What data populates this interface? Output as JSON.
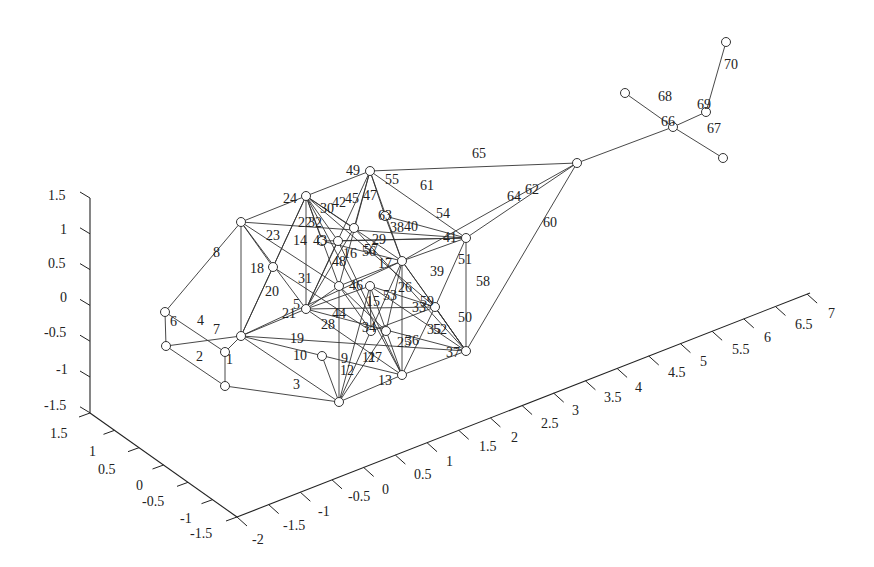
{
  "chart_data": {
    "type": "scatter",
    "subtype": "3d-network-graph",
    "title": "",
    "axes": {
      "z": {
        "ticks": [
          "1.5",
          "1",
          "0.5",
          "0",
          "-0.5",
          "-1",
          "-1.5"
        ],
        "range": [
          -1.5,
          1.5
        ]
      },
      "y": {
        "ticks": [
          "1.5",
          "1",
          "0.5",
          "0",
          "-0.5",
          "-1",
          "-1.5"
        ],
        "range": [
          -1.5,
          1.5
        ]
      },
      "x": {
        "ticks": [
          "-2",
          "-1.5",
          "-1",
          "-0.5",
          "0",
          "0.5",
          "1",
          "1.5",
          "2",
          "2.5",
          "3",
          "3.5",
          "4",
          "4.5",
          "5",
          "5.5",
          "6",
          "6.5",
          "7"
        ],
        "range": [
          -2,
          7
        ]
      }
    },
    "grid": false,
    "legend": null,
    "nodes": {
      "A": [
        165,
        312
      ],
      "B": [
        166,
        346
      ],
      "C": [
        225,
        352
      ],
      "D": [
        225,
        386
      ],
      "E": [
        241,
        222
      ],
      "F": [
        241,
        336
      ],
      "G": [
        273,
        267
      ],
      "H": [
        306,
        196
      ],
      "I": [
        306,
        309
      ],
      "J": [
        322,
        356
      ],
      "K": [
        339,
        402
      ],
      "L": [
        322,
        241
      ],
      "M": [
        338,
        241
      ],
      "N": [
        370,
        171
      ],
      "O": [
        354,
        228
      ],
      "P": [
        339,
        286
      ],
      "Q": [
        370,
        286
      ],
      "S": [
        402,
        261
      ],
      "T": [
        371,
        331
      ],
      "U": [
        386,
        331
      ],
      "V": [
        402,
        375
      ],
      "W": [
        435,
        307
      ],
      "X": [
        466,
        238
      ],
      "Y": [
        466,
        351
      ],
      "Z": [
        577,
        163
      ],
      "AA": [
        673,
        127
      ],
      "AB": [
        625,
        93
      ],
      "AC": [
        706,
        112
      ],
      "AD": [
        723,
        158
      ],
      "AE": [
        726,
        42
      ],
      "AF": [
        385,
        216
      ]
    },
    "edges": [
      {
        "id": "1",
        "from": "C",
        "to": "D",
        "lx": 226,
        "ly": 364
      },
      {
        "id": "2",
        "from": "B",
        "to": "D",
        "lx": 196,
        "ly": 361
      },
      {
        "id": "3",
        "from": "D",
        "to": "K",
        "lx": 293,
        "ly": 389
      },
      {
        "id": "4",
        "from": "A",
        "to": "C",
        "lx": 197,
        "ly": 325
      },
      {
        "id": "5",
        "from": "H",
        "to": "I",
        "lx": 293,
        "ly": 309
      },
      {
        "id": "6",
        "from": "A",
        "to": "B",
        "lx": 170,
        "ly": 326
      },
      {
        "id": "7",
        "from": "B",
        "to": "F",
        "lx": 213,
        "ly": 334
      },
      {
        "id": "8",
        "from": "A",
        "to": "E",
        "lx": 213,
        "ly": 257
      },
      {
        "id": "9",
        "from": "I",
        "to": "V",
        "lx": 341,
        "ly": 363
      },
      {
        "id": "10",
        "from": "F",
        "to": "V",
        "lx": 293,
        "ly": 360
      },
      {
        "id": "11",
        "from": "K",
        "to": "U",
        "lx": 362,
        "ly": 362
      },
      {
        "id": "12",
        "from": "J",
        "to": "K",
        "lx": 340,
        "ly": 375
      },
      {
        "id": "13",
        "from": "K",
        "to": "V",
        "lx": 378,
        "ly": 385
      },
      {
        "id": "14",
        "from": "E",
        "to": "P",
        "lx": 293,
        "ly": 245
      },
      {
        "id": "15",
        "from": "M",
        "to": "V",
        "lx": 366,
        "ly": 306
      },
      {
        "id": "16",
        "from": "H",
        "to": "P",
        "lx": 343,
        "ly": 258
      },
      {
        "id": "17",
        "from": "U",
        "to": "S",
        "lx": 378,
        "ly": 268
      },
      {
        "id": "18",
        "from": "E",
        "to": "F",
        "lx": 250,
        "ly": 273
      },
      {
        "id": "19",
        "from": "F",
        "to": "Y",
        "lx": 290,
        "ly": 343
      },
      {
        "id": "20",
        "from": "F",
        "to": "G",
        "lx": 265,
        "ly": 296
      },
      {
        "id": "21",
        "from": "F",
        "to": "S",
        "lx": 282,
        "ly": 318
      },
      {
        "id": "22",
        "from": "H",
        "to": "F",
        "lx": 298,
        "ly": 227
      },
      {
        "id": "23",
        "from": "E",
        "to": "X",
        "lx": 266,
        "ly": 240
      },
      {
        "id": "24",
        "from": "E",
        "to": "H",
        "lx": 283,
        "ly": 203
      },
      {
        "id": "25",
        "from": "V",
        "to": "Q",
        "lx": 397,
        "ly": 347
      },
      {
        "id": "26",
        "from": "S",
        "to": "V",
        "lx": 398,
        "ly": 292
      },
      {
        "id": "27",
        "from": "K",
        "to": "Q",
        "lx": 368,
        "ly": 362
      },
      {
        "id": "28",
        "from": "I",
        "to": "Y",
        "lx": 321,
        "ly": 329
      },
      {
        "id": "29",
        "from": "H",
        "to": "V",
        "lx": 372,
        "ly": 244
      },
      {
        "id": "30",
        "from": "H",
        "to": "W",
        "lx": 320,
        "ly": 213
      },
      {
        "id": "31",
        "from": "G",
        "to": "T",
        "lx": 298,
        "ly": 283
      },
      {
        "id": "32",
        "from": "H",
        "to": "G",
        "lx": 308,
        "ly": 227
      },
      {
        "id": "33",
        "from": "S",
        "to": "U",
        "lx": 412,
        "ly": 312
      },
      {
        "id": "34",
        "from": "P",
        "to": "T",
        "lx": 362,
        "ly": 332
      },
      {
        "id": "35",
        "from": "V",
        "to": "W",
        "lx": 427,
        "ly": 334
      },
      {
        "id": "36",
        "from": "V",
        "to": "S",
        "lx": 405,
        "ly": 345
      },
      {
        "id": "37",
        "from": "V",
        "to": "Y",
        "lx": 446,
        "ly": 357
      },
      {
        "id": "38",
        "from": "O",
        "to": "Y",
        "lx": 390,
        "ly": 232
      },
      {
        "id": "39",
        "from": "S",
        "to": "Y",
        "lx": 430,
        "ly": 276
      },
      {
        "id": "40",
        "from": "AF",
        "to": "X",
        "lx": 404,
        "ly": 231
      },
      {
        "id": "41",
        "from": "S",
        "to": "X",
        "lx": 443,
        "ly": 242
      },
      {
        "id": "42",
        "from": "H",
        "to": "M",
        "lx": 332,
        "ly": 207
      },
      {
        "id": "43",
        "from": "L",
        "to": "S",
        "lx": 313,
        "ly": 245
      },
      {
        "id": "44",
        "from": "I",
        "to": "V2",
        "lx": 332,
        "ly": 318
      },
      {
        "id": "45",
        "from": "N",
        "to": "I",
        "lx": 345,
        "ly": 203
      },
      {
        "id": "46",
        "from": "P",
        "to": "I",
        "lx": 349,
        "ly": 290
      },
      {
        "id": "47",
        "from": "N",
        "to": "P",
        "lx": 363,
        "ly": 200
      },
      {
        "id": "48",
        "from": "I",
        "to": "O",
        "lx": 332,
        "ly": 266
      },
      {
        "id": "49",
        "from": "H",
        "to": "N",
        "lx": 346,
        "ly": 175
      },
      {
        "id": "50",
        "from": "W",
        "to": "Y",
        "lx": 458,
        "ly": 322
      },
      {
        "id": "51",
        "from": "X",
        "to": "W",
        "lx": 458,
        "ly": 264
      },
      {
        "id": "52",
        "from": "I",
        "to": "Y2",
        "lx": 433,
        "ly": 334
      },
      {
        "id": "53",
        "from": "Q",
        "to": "W",
        "lx": 383,
        "ly": 300
      },
      {
        "id": "54",
        "from": "N",
        "to": "X",
        "lx": 436,
        "ly": 218
      },
      {
        "id": "55",
        "from": "N",
        "to": "AF",
        "lx": 385,
        "ly": 184
      },
      {
        "id": "56",
        "from": "M",
        "to": "X",
        "lx": 362,
        "ly": 256
      },
      {
        "id": "57",
        "from": "L",
        "to": "X2",
        "lx": 364,
        "ly": 254
      },
      {
        "id": "58",
        "from": "X",
        "to": "Y",
        "lx": 476,
        "ly": 286
      },
      {
        "id": "59",
        "from": "S",
        "to": "W",
        "lx": 420,
        "ly": 306
      },
      {
        "id": "60",
        "from": "Y",
        "to": "Z",
        "lx": 543,
        "ly": 227
      },
      {
        "id": "61",
        "from": "N",
        "to": "X3",
        "lx": 420,
        "ly": 190
      },
      {
        "id": "62",
        "from": "X",
        "to": "Z",
        "lx": 525,
        "ly": 194
      },
      {
        "id": "63",
        "from": "N",
        "to": "AF2",
        "lx": 378,
        "ly": 220
      },
      {
        "id": "64",
        "from": "S",
        "to": "Z",
        "lx": 507,
        "ly": 201
      },
      {
        "id": "65",
        "from": "N",
        "to": "Z",
        "lx": 472,
        "ly": 158
      },
      {
        "id": "66",
        "from": "Z",
        "to": "AA",
        "lx": 661,
        "ly": 126
      },
      {
        "id": "67",
        "from": "AA",
        "to": "AD",
        "lx": 707,
        "ly": 133
      },
      {
        "id": "68",
        "from": "AB",
        "to": "AA",
        "lx": 658,
        "ly": 101
      },
      {
        "id": "69",
        "from": "AA",
        "to": "AC",
        "lx": 697,
        "ly": 109
      },
      {
        "id": "70",
        "from": "AC",
        "to": "AE",
        "lx": 724,
        "ly": 69
      }
    ]
  },
  "labels": {
    "z_ticks": [
      {
        "t": "1.5",
        "x": 48,
        "y": 200
      },
      {
        "t": "1",
        "x": 60,
        "y": 234
      },
      {
        "t": "0.5",
        "x": 48,
        "y": 268
      },
      {
        "t": "0",
        "x": 60,
        "y": 302
      },
      {
        "t": "-0.5",
        "x": 44,
        "y": 337
      },
      {
        "t": "-1",
        "x": 56,
        "y": 374
      },
      {
        "t": "-1.5",
        "x": 44,
        "y": 410
      }
    ],
    "y_ticks": [
      {
        "t": "1.5",
        "x": 50,
        "y": 438
      },
      {
        "t": "1",
        "x": 89,
        "y": 456
      },
      {
        "t": "0.5",
        "x": 98,
        "y": 474
      },
      {
        "t": "0",
        "x": 136,
        "y": 490
      },
      {
        "t": "-0.5",
        "x": 142,
        "y": 506
      },
      {
        "t": "-1",
        "x": 180,
        "y": 523
      },
      {
        "t": "-1.5",
        "x": 190,
        "y": 538
      }
    ],
    "x_ticks": [
      {
        "t": "-2",
        "x": 252,
        "y": 544
      },
      {
        "t": "-1.5",
        "x": 283,
        "y": 530
      },
      {
        "t": "-1",
        "x": 318,
        "y": 516
      },
      {
        "t": "-0.5",
        "x": 348,
        "y": 501
      },
      {
        "t": "0",
        "x": 382,
        "y": 494
      },
      {
        "t": "0.5",
        "x": 414,
        "y": 479
      },
      {
        "t": "1",
        "x": 446,
        "y": 466
      },
      {
        "t": "1.5",
        "x": 479,
        "y": 451
      },
      {
        "t": "2",
        "x": 511,
        "y": 442
      },
      {
        "t": "2.5",
        "x": 541,
        "y": 428
      },
      {
        "t": "3",
        "x": 572,
        "y": 415
      },
      {
        "t": "3.5",
        "x": 604,
        "y": 402
      },
      {
        "t": "4",
        "x": 635,
        "y": 392
      },
      {
        "t": "4.5",
        "x": 668,
        "y": 377
      },
      {
        "t": "5",
        "x": 700,
        "y": 366
      },
      {
        "t": "5.5",
        "x": 732,
        "y": 354
      },
      {
        "t": "6",
        "x": 764,
        "y": 342
      },
      {
        "t": "6.5",
        "x": 795,
        "y": 329
      },
      {
        "t": "7",
        "x": 828,
        "y": 318
      }
    ]
  }
}
